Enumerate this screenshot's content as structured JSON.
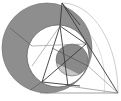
{
  "diagram": {
    "title": "",
    "colors": {
      "background": "#ffffff",
      "ring_fill": "#8c8c8c",
      "small_circle_dark": "#8a8a8a",
      "small_circle_light": "#c4c4c4",
      "line": "#3a3a3a",
      "thin_line": "#9a9a9a",
      "arc": "#bdbdbd"
    },
    "labels": []
  }
}
